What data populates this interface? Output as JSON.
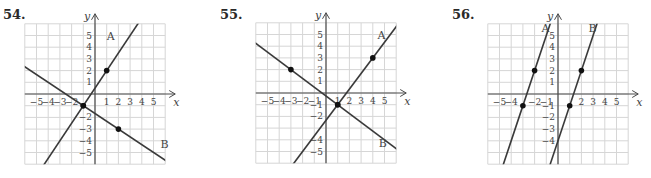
{
  "chart_data": [
    {
      "type": "line",
      "problem_number": "54.",
      "xlabel": "x",
      "ylabel": "y",
      "xlim": [
        -6,
        6
      ],
      "ylim": [
        -6,
        6
      ],
      "grid": true,
      "x_tick_labels": [
        "-5",
        "-4",
        "-3",
        "-2",
        "1",
        "2",
        "3",
        "4",
        "5"
      ],
      "y_tick_labels": [
        "5",
        "4",
        "3",
        "2",
        "1",
        "-2",
        "-3",
        "-4",
        "-5"
      ],
      "series": [
        {
          "name": "A",
          "points": [
            [
              -1,
              -1
            ],
            [
              1,
              2
            ]
          ],
          "slope": 1.5,
          "intercept": 0.5
        },
        {
          "name": "B",
          "points": [
            [
              -1,
              -1
            ],
            [
              2,
              -3
            ]
          ],
          "slope": -0.6667,
          "intercept": -1.6667
        }
      ]
    },
    {
      "type": "line",
      "problem_number": "55.",
      "xlabel": "x",
      "ylabel": "y",
      "xlim": [
        -6,
        6
      ],
      "ylim": [
        -6,
        6
      ],
      "grid": true,
      "x_tick_labels": [
        "-5",
        "-4",
        "-3",
        "-2",
        "-1",
        "1",
        "2",
        "3",
        "4",
        "5"
      ],
      "y_tick_labels": [
        "5",
        "4",
        "3",
        "2",
        "1",
        "-1",
        "-2",
        "-4",
        "-5"
      ],
      "series": [
        {
          "name": "A",
          "points": [
            [
              1,
              -1
            ],
            [
              4,
              3
            ]
          ],
          "slope": 1.3333,
          "intercept": -2.3333
        },
        {
          "name": "B",
          "points": [
            [
              -3,
              2
            ],
            [
              1,
              -1
            ]
          ],
          "slope": -0.75,
          "intercept": -0.25
        }
      ]
    },
    {
      "type": "line",
      "problem_number": "56.",
      "xlabel": "x",
      "ylabel": "y",
      "xlim": [
        -6,
        6
      ],
      "ylim": [
        -6,
        6
      ],
      "grid": true,
      "x_tick_labels": [
        "-5",
        "-4",
        "-2",
        "-1",
        "2",
        "3",
        "4",
        "5"
      ],
      "y_tick_labels": [
        "5",
        "4",
        "3",
        "2",
        "1",
        "-1",
        "-2",
        "-3",
        "-4"
      ],
      "series": [
        {
          "name": "A",
          "points": [
            [
              -3,
              -1
            ],
            [
              -2,
              2
            ]
          ],
          "slope": 3,
          "intercept": 8
        },
        {
          "name": "B",
          "points": [
            [
              1,
              -1
            ],
            [
              2,
              2
            ]
          ],
          "slope": 3,
          "intercept": -4
        }
      ]
    }
  ],
  "layout": {
    "cell": 11.7,
    "panels": [
      {
        "origin": [
          95,
          94
        ],
        "label_pos": [
          3,
          9
        ],
        "label_A": [
          1,
          4.6
        ],
        "label_B": [
          5.6,
          -4.6
        ]
      },
      {
        "origin": [
          326,
          93
        ],
        "label_pos": [
          220,
          9
        ],
        "label_A": [
          4.4,
          4.6
        ],
        "label_B": [
          4.5,
          -4.6
        ]
      },
      {
        "origin": [
          558,
          94
        ],
        "label_pos": [
          452,
          9
        ],
        "label_A": [
          -1.4,
          5.3
        ],
        "label_B": [
          2.6,
          5.3
        ]
      }
    ],
    "colors": {
      "grid": "#d6d6d6",
      "axis": "#4a4a4a",
      "line": "#3a3a3a",
      "text": "#444444",
      "point": "#111111"
    }
  }
}
